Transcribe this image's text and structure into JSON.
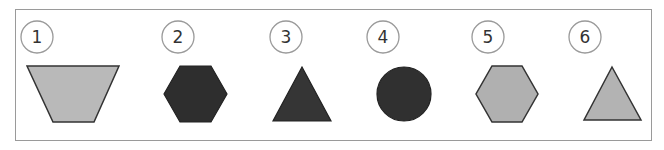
{
  "figure": {
    "items": [
      {
        "label": "1",
        "shape": "trapezoid-inverted",
        "fill": "#b9b9b9"
      },
      {
        "label": "2",
        "shape": "hexagon",
        "fill": "#2e2e2e"
      },
      {
        "label": "3",
        "shape": "triangle",
        "fill": "#353535"
      },
      {
        "label": "4",
        "shape": "circle",
        "fill": "#303030"
      },
      {
        "label": "5",
        "shape": "hexagon",
        "fill": "#b0b0b0"
      },
      {
        "label": "6",
        "shape": "triangle",
        "fill": "#b3b3b3"
      }
    ],
    "stroke": "#333333",
    "badge_stroke": "#9a9a9a"
  }
}
